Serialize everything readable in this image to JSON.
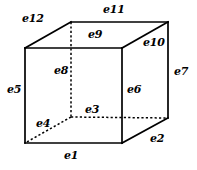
{
  "figure": {
    "width": 197,
    "height": 170,
    "background": "#ffffff",
    "stroke_color": "#000000",
    "label_color": "#000000",
    "type": "cube-edge-diagram"
  },
  "geometry": {
    "vertices": {
      "front_top_left": [
        25,
        48
      ],
      "front_top_right": [
        122,
        48
      ],
      "front_bottom_left": [
        25,
        143
      ],
      "front_bottom_right": [
        122,
        143
      ],
      "back_top_left": [
        71,
        22
      ],
      "back_top_right": [
        168,
        22
      ],
      "back_bottom_left": [
        71,
        117
      ],
      "back_bottom_right": [
        168,
        118
      ]
    },
    "solid_path": "M25,48 L122,48 L122,143 L25,143 Z M25,48 L71,22 L168,22 L168,118 L122,143 M122,48 L168,22",
    "dashed_segments": [
      {
        "name": "e8",
        "from": [
          71,
          22
        ],
        "to": [
          71,
          117
        ]
      },
      {
        "name": "e3",
        "from": [
          71,
          117
        ],
        "to": [
          168,
          118
        ]
      },
      {
        "name": "e4",
        "from": [
          71,
          117
        ],
        "to": [
          25,
          143
        ]
      }
    ]
  },
  "edges": [
    {
      "id": "e1",
      "label": "e1",
      "x": 64,
      "y": 150,
      "hidden": false,
      "position": "front-bottom-horizontal"
    },
    {
      "id": "e2",
      "label": "e2",
      "x": 150,
      "y": 133,
      "hidden": false,
      "position": "bottom-right-receding"
    },
    {
      "id": "e3",
      "label": "e3",
      "x": 85,
      "y": 104,
      "hidden": true,
      "position": "back-bottom-horizontal"
    },
    {
      "id": "e4",
      "label": "e4",
      "x": 36,
      "y": 118,
      "hidden": true,
      "position": "bottom-left-receding"
    },
    {
      "id": "e5",
      "label": "e5",
      "x": 7,
      "y": 84,
      "hidden": false,
      "position": "front-left-vertical"
    },
    {
      "id": "e6",
      "label": "e6",
      "x": 127,
      "y": 84,
      "hidden": false,
      "position": "front-right-vertical"
    },
    {
      "id": "e7",
      "label": "e7",
      "x": 174,
      "y": 66,
      "hidden": false,
      "position": "back-right-vertical"
    },
    {
      "id": "e8",
      "label": "e8",
      "x": 54,
      "y": 65,
      "hidden": true,
      "position": "back-left-vertical"
    },
    {
      "id": "e9",
      "label": "e9",
      "x": 88,
      "y": 29,
      "hidden": false,
      "position": "top-front-horizontal"
    },
    {
      "id": "e10",
      "label": "e10",
      "x": 143,
      "y": 37,
      "hidden": false,
      "position": "top-right-receding"
    },
    {
      "id": "e11",
      "label": "e11",
      "x": 103,
      "y": 4,
      "hidden": false,
      "position": "top-back-horizontal"
    },
    {
      "id": "e12",
      "label": "e12",
      "x": 22,
      "y": 13,
      "hidden": false,
      "position": "top-left-receding"
    }
  ]
}
